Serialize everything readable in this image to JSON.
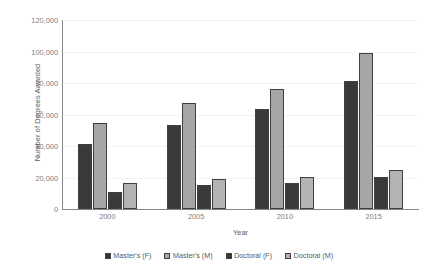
{
  "chart_data": {
    "type": "bar",
    "title": "",
    "xlabel": "Year",
    "ylabel": "Number of Degrees Awarded",
    "categories": [
      "2000",
      "2005",
      "2010",
      "2015"
    ],
    "ylim": [
      0,
      120000
    ],
    "ytick_values": [
      0,
      20000,
      40000,
      60000,
      80000,
      100000,
      120000
    ],
    "ytick_labels": [
      "0",
      "20,000",
      "40,000",
      "60,000",
      "80,000",
      "100,000",
      "120,000"
    ],
    "grid": true,
    "grid_axis": "y",
    "legend_position": "bottom",
    "series": [
      {
        "name": "Master's (F)",
        "color": "#3a3a3a",
        "values": [
          41500,
          53500,
          63500,
          81500
        ]
      },
      {
        "name": "Master's (M)",
        "color": "#a6a6a6",
        "values": [
          54500,
          67000,
          76000,
          99000
        ]
      },
      {
        "name": "Doctoral (F)",
        "color": "#3a3a3a",
        "values": [
          11000,
          15500,
          16500,
          20500
        ]
      },
      {
        "name": "Doctoral (M)",
        "color": "#b3b3b3",
        "values": [
          16500,
          19000,
          20500,
          24500
        ]
      }
    ]
  },
  "axes": {
    "y_title": "Number of Degrees Awarded",
    "x_title": "Year"
  }
}
